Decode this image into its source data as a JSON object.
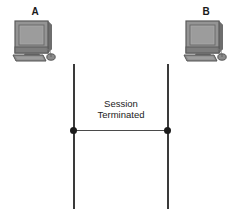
{
  "diagram": {
    "type": "network-sequence-diagram",
    "background_color": "#ffffff",
    "line_color": "#3a3a3a",
    "dot_color": "#1c1c1c",
    "text_color": "#222222"
  },
  "hosts": [
    {
      "id": "a",
      "label": "A",
      "icon": "desktop-computer-icon",
      "side": "left"
    },
    {
      "id": "b",
      "label": "B",
      "icon": "desktop-computer-icon",
      "side": "right"
    }
  ],
  "message": {
    "label_line1": "Session",
    "label_line2": "Terminated",
    "endpoint_left": "message-endpoint-dot",
    "endpoint_right": "message-endpoint-dot"
  }
}
